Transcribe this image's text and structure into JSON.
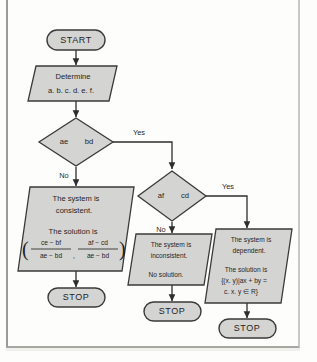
{
  "diagram": {
    "type": "flowchart",
    "colors": {
      "shape_fill": "#d4d4d2",
      "shape_stroke": "#3a3a3a",
      "connector": "#2e2e2e",
      "page_background": "#fdfdfb",
      "frame_border": "#9a9a96"
    },
    "nodes": {
      "start": {
        "shape": "terminator",
        "label": "START"
      },
      "determine": {
        "shape": "parallelogram",
        "line1": "Determine",
        "line2": "a. b. c. d. e. f."
      },
      "decision1": {
        "shape": "diamond",
        "left": "ae",
        "operator": "",
        "right": "bd",
        "yes_label": "Yes",
        "no_label": "No"
      },
      "decision2": {
        "shape": "diamond",
        "left": "af",
        "operator": "",
        "right": "cd",
        "yes_label": "Yes",
        "no_label": "No"
      },
      "consistent": {
        "shape": "parallelogram",
        "line1": "The system is",
        "line2": "consistent.",
        "line3": "The solution is",
        "fraction1_num": "ce  −  bf",
        "fraction1_den": "ae  −  bd",
        "fraction2_num": "af  −  cd",
        "fraction2_den": "ae  −  bd",
        "paren_open": "(",
        "paren_close": ")",
        "comma": ","
      },
      "inconsistent": {
        "shape": "parallelogram",
        "line1": "The system is",
        "line2": "inconsistent.",
        "line3": "No solution."
      },
      "dependent": {
        "shape": "parallelogram",
        "line1": "The system is",
        "line2": "dependent.",
        "line3": "The solution is",
        "line4": "{(x. y)|ax  +  by  =",
        "line5": "c. x. y ∈ R}"
      },
      "stop_left": {
        "shape": "terminator",
        "label": "STOP"
      },
      "stop_middle": {
        "shape": "terminator",
        "label": "STOP"
      },
      "stop_right": {
        "shape": "terminator",
        "label": "STOP"
      }
    },
    "edges": [
      {
        "from": "start",
        "to": "determine",
        "label": ""
      },
      {
        "from": "determine",
        "to": "decision1",
        "label": ""
      },
      {
        "from": "decision1",
        "to": "decision2",
        "label": "Yes"
      },
      {
        "from": "decision1",
        "to": "consistent",
        "label": "No"
      },
      {
        "from": "decision2",
        "to": "dependent",
        "label": "Yes"
      },
      {
        "from": "decision2",
        "to": "inconsistent",
        "label": "No"
      },
      {
        "from": "consistent",
        "to": "stop_left",
        "label": ""
      },
      {
        "from": "inconsistent",
        "to": "stop_middle",
        "label": ""
      },
      {
        "from": "dependent",
        "to": "stop_right",
        "label": ""
      }
    ]
  }
}
